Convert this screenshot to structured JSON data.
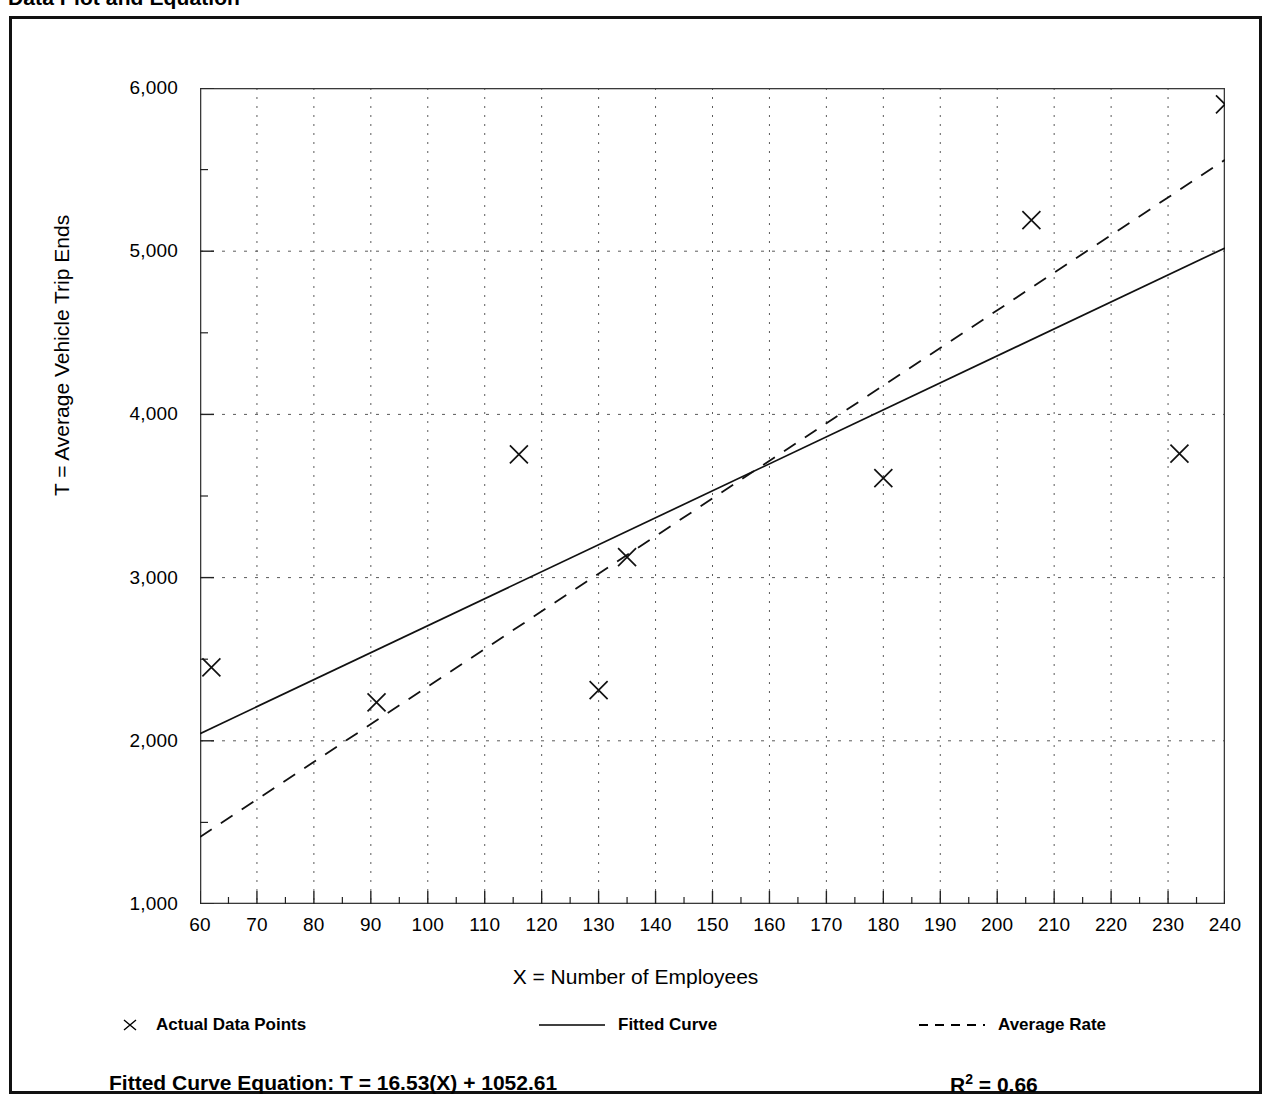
{
  "title": "Data Plot and Equation",
  "legend": {
    "items": [
      {
        "label": "Actual Data Points",
        "style": "marker-x"
      },
      {
        "label": "Fitted Curve",
        "style": "solid-line"
      },
      {
        "label": "Average Rate",
        "style": "dashed-line"
      }
    ]
  },
  "footer": {
    "equation_label": "Fitted Curve Equation:",
    "equation": "T = 16.53(X) + 1052.61",
    "equation_full": "Fitted Curve Equation:  T = 16.53(X) + 1052.61",
    "r_squared_symbol": "R",
    "r_squared_exponent": "2",
    "r_squared_value": "= 0.66",
    "r_squared_full": "R2 = 0.66"
  },
  "chart_data": {
    "type": "scatter",
    "title": "Data Plot and Equation",
    "xlabel": "X = Number of Employees",
    "ylabel": "T = Average Vehicle Trip Ends",
    "xlim": [
      60,
      240
    ],
    "ylim": [
      1000,
      6000
    ],
    "xticks": [
      60,
      70,
      80,
      90,
      100,
      110,
      120,
      130,
      140,
      150,
      160,
      170,
      180,
      190,
      200,
      210,
      220,
      230,
      240
    ],
    "xtick_labels": [
      "60",
      "70",
      "80",
      "90",
      "100",
      "110",
      "120",
      "130",
      "140",
      "150",
      "160",
      "170",
      "180",
      "190",
      "200",
      "210",
      "220",
      "230",
      "240"
    ],
    "yticks": [
      1000,
      2000,
      3000,
      4000,
      5000,
      6000
    ],
    "ytick_labels": [
      "1,000",
      "2,000",
      "3,000",
      "4,000",
      "5,000",
      "6,000"
    ],
    "grid": true,
    "grid_style": "dotted",
    "legend_position": "below-axis",
    "series": [
      {
        "name": "Actual Data Points",
        "type": "scatter",
        "marker": "x",
        "points": [
          {
            "x": 62,
            "y": 2450
          },
          {
            "x": 91,
            "y": 2235
          },
          {
            "x": 116,
            "y": 3755
          },
          {
            "x": 130,
            "y": 2310
          },
          {
            "x": 135,
            "y": 3125
          },
          {
            "x": 180,
            "y": 3610
          },
          {
            "x": 206,
            "y": 5190
          },
          {
            "x": 232,
            "y": 3760
          },
          {
            "x": 240,
            "y": 5900
          }
        ]
      },
      {
        "name": "Fitted Curve",
        "type": "line",
        "style": "solid",
        "equation": "T = 16.53(X) + 1052.61",
        "slope": 16.53,
        "intercept": 1052.61,
        "endpoints": [
          {
            "x": 60,
            "y": 2044
          },
          {
            "x": 240,
            "y": 5020
          }
        ]
      },
      {
        "name": "Average Rate",
        "type": "line",
        "style": "dashed",
        "endpoints": [
          {
            "x": 60,
            "y": 1410
          },
          {
            "x": 240,
            "y": 5560
          }
        ]
      }
    ],
    "annotations": [
      {
        "text": "Fitted Curve Equation:  T = 16.53(X) + 1052.61",
        "position": "below-legend-left"
      },
      {
        "text": "R2 = 0.66",
        "position": "below-legend-right"
      }
    ]
  }
}
